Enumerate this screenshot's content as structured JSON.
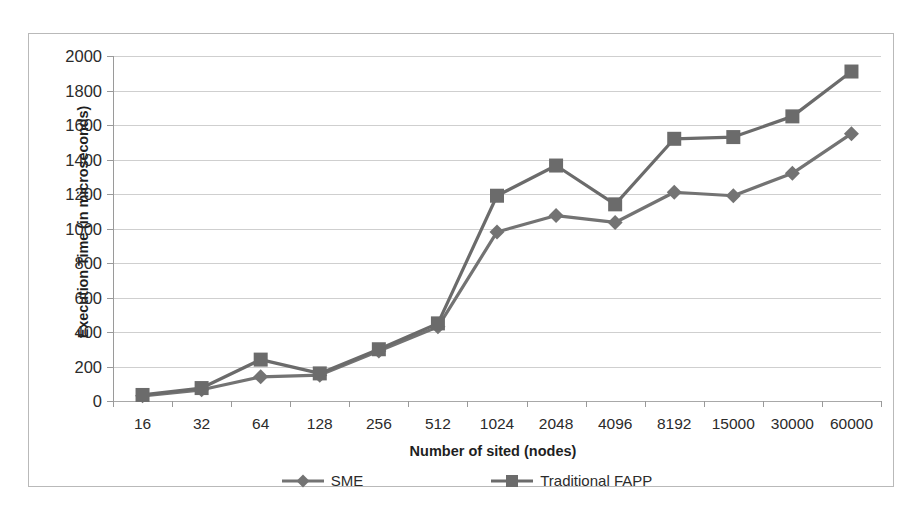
{
  "chart_data": {
    "type": "line",
    "title": "",
    "xlabel": "Number of sited (nodes)",
    "ylabel": "Execution Time (in microseconds)",
    "categories": [
      "16",
      "32",
      "64",
      "128",
      "256",
      "512",
      "1024",
      "2048",
      "4096",
      "8192",
      "15000",
      "30000",
      "60000"
    ],
    "ylim": [
      0,
      2000
    ],
    "yticks": [
      0,
      200,
      400,
      600,
      800,
      1000,
      1200,
      1400,
      1600,
      1800,
      2000
    ],
    "grid": true,
    "legend_position": "bottom",
    "series": [
      {
        "name": "SME",
        "marker": "diamond",
        "color": "#737373",
        "values": [
          30,
          65,
          140,
          150,
          290,
          430,
          980,
          1075,
          1035,
          1210,
          1190,
          1320,
          1550
        ]
      },
      {
        "name": "Traditional FAPP",
        "marker": "square",
        "color": "#6b6b6b",
        "values": [
          35,
          75,
          240,
          160,
          300,
          450,
          1190,
          1365,
          1140,
          1520,
          1530,
          1650,
          1910
        ]
      }
    ]
  },
  "legend": {
    "items": [
      {
        "label": "SME",
        "marker": "diamond-marker"
      },
      {
        "label": "Traditional FAPP",
        "marker": "square-marker"
      }
    ]
  },
  "colors": {
    "series_sme": "#737373",
    "series_fapp": "#6b6b6b",
    "gridline": "#cfcfcf",
    "axis": "#9a9a9a",
    "frame": "#b9b9b9",
    "text": "#2b2b2b",
    "background": "#ffffff"
  }
}
